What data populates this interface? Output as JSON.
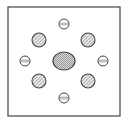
{
  "diagram": {
    "frame": {
      "x": 8,
      "y": 7,
      "width": 112,
      "height": 109,
      "stroke": "#444444"
    },
    "center_element": {
      "cx": 64,
      "cy": 61,
      "rx": 11,
      "ry": 9,
      "fill": "#bdbdbd",
      "pattern": "crosshatch"
    },
    "diagonal_elements": [
      {
        "cx": 39,
        "cy": 40,
        "r": 7,
        "pattern": "diagonal-hatch"
      },
      {
        "cx": 88,
        "cy": 40,
        "r": 7,
        "pattern": "diagonal-hatch"
      },
      {
        "cx": 39,
        "cy": 81,
        "r": 7,
        "pattern": "diagonal-hatch"
      },
      {
        "cx": 88,
        "cy": 81,
        "r": 7,
        "pattern": "diagonal-hatch"
      }
    ],
    "axial_elements": [
      {
        "position": "top",
        "cx": 64,
        "cy": 24,
        "r": 5
      },
      {
        "position": "bottom",
        "cx": 64,
        "cy": 98,
        "r": 5
      },
      {
        "position": "left",
        "cx": 25,
        "cy": 61,
        "r": 5
      },
      {
        "position": "right",
        "cx": 103,
        "cy": 61,
        "r": 5
      }
    ],
    "colors": {
      "stroke": "#444444",
      "hatch": "#8a8a8a",
      "background": "#ffffff"
    }
  }
}
